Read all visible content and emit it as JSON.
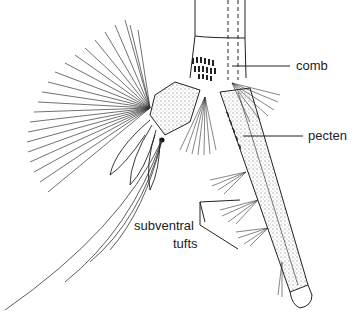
{
  "figure": {
    "line_color": "#222222",
    "background": "#ffffff"
  },
  "labels": {
    "comb": "comb",
    "pecten": "pecten",
    "subventral_line1": "subventral",
    "subventral_line2": "tufts"
  }
}
